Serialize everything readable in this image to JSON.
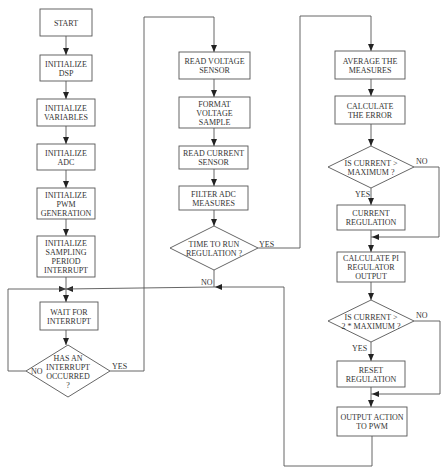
{
  "nodes": {
    "start": [
      "START"
    ],
    "init_dsp": [
      "INITIALIZE",
      "DSP"
    ],
    "init_vars": [
      "INITIALIZE",
      "VARIABLES"
    ],
    "init_adc": [
      "INITIALIZE",
      "ADC"
    ],
    "init_pwm": [
      "INITIALIZE",
      "PWM",
      "GENERATION"
    ],
    "init_sampling": [
      "INITIALIZE",
      "SAMPLING",
      "PERIOD",
      "INTERRUPT"
    ],
    "wait": [
      "WAIT FOR",
      "INTERRUPT"
    ],
    "has_interrupt": [
      "HAS AN",
      "INTERRUPT",
      "OCCURRED",
      "?"
    ],
    "read_voltage": [
      "READ VOLTAGE",
      "SENSOR"
    ],
    "format_voltage": [
      "FORMAT",
      "VOLTAGE",
      "SAMPLE"
    ],
    "read_current": [
      "READ CURRENT",
      "SENSOR"
    ],
    "filter_adc": [
      "FILTER ADC",
      "MEASURES"
    ],
    "time_to_run": [
      "TIME TO RUN",
      "REGULATION ?"
    ],
    "average": [
      "AVERAGE THE",
      "MEASURES"
    ],
    "calc_error": [
      "CALCULATE",
      "THE ERROR"
    ],
    "is_current_max": [
      "IS CURRENT >",
      "MAXIMUM ?"
    ],
    "current_reg": [
      "CURRENT",
      "REGULATION"
    ],
    "calc_pi": [
      "CALCULATE PI",
      "REGULATOR",
      "OUTPUT"
    ],
    "is_current_2max": [
      "IS CURRENT >",
      "2 * MAXIMUM ?"
    ],
    "reset_reg": [
      "RESET",
      "REGULATION"
    ],
    "output_pwm": [
      "OUTPUT ACTION",
      "TO PWM"
    ]
  },
  "labels": {
    "yes": "YES",
    "no": "NO"
  }
}
